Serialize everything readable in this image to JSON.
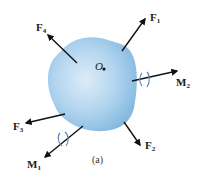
{
  "diagram": {
    "caption": "(a)",
    "body": {
      "fill_center": "#d6e9f7",
      "fill_edge": "#8fbfe3"
    },
    "origin": {
      "label": "O"
    },
    "forces": [
      {
        "id": "F1",
        "symbol": "F",
        "subscript": "1"
      },
      {
        "id": "F2",
        "symbol": "F",
        "subscript": "2"
      },
      {
        "id": "F3",
        "symbol": "F",
        "subscript": "3"
      },
      {
        "id": "F4",
        "symbol": "F",
        "subscript": "4"
      }
    ],
    "moments": [
      {
        "id": "M1",
        "symbol": "M",
        "subscript": "1"
      },
      {
        "id": "M2",
        "symbol": "M",
        "subscript": "2"
      }
    ],
    "colors": {
      "arrow": "#111111",
      "twist": "#5a86b8"
    }
  }
}
